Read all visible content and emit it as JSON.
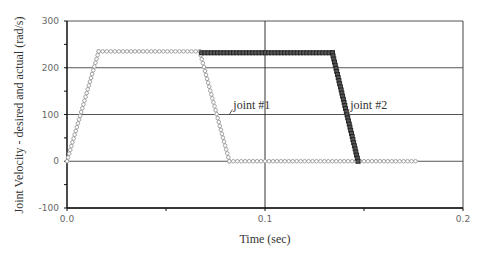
{
  "chart_data": {
    "type": "line",
    "title": "",
    "xlabel": "Time (sec)",
    "ylabel": "Joint Velocity - desired and actual (rad/s)",
    "xlim": [
      0.0,
      0.2
    ],
    "ylim": [
      -100,
      300
    ],
    "xticks": [
      "0.0",
      "0.1",
      "0.2"
    ],
    "yticks": [
      "300",
      "200",
      "100",
      "0",
      "-100"
    ],
    "grid": {
      "horizontal": true,
      "vertical_at": [
        0.1
      ]
    },
    "legend": null,
    "annotations": [
      {
        "text": "joint #1",
        "x": 0.082,
        "y": 100
      },
      {
        "text": "joint #2",
        "x": 0.141,
        "y": 100
      }
    ],
    "series": [
      {
        "name": "joint #1",
        "marker": "circle",
        "color": "#9a9a9a",
        "x": [
          0.0,
          0.016,
          0.067,
          0.082,
          0.176
        ],
        "y": [
          0,
          235,
          235,
          0,
          0
        ]
      },
      {
        "name": "joint #2",
        "marker": "square",
        "color": "#222222",
        "x": [
          0.068,
          0.134,
          0.147
        ],
        "y": [
          232,
          232,
          0
        ]
      }
    ]
  }
}
